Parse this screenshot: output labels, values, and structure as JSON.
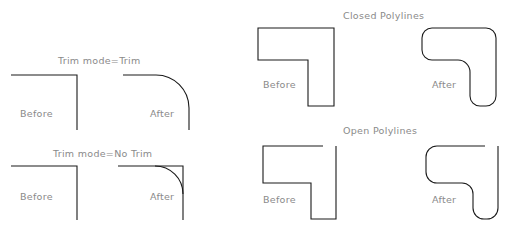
{
  "panels": {
    "trim": {
      "title": "Trim  mode=Trim",
      "before_label": "Before",
      "after_label": "After"
    },
    "no_trim": {
      "title": "Trim  mode=No  Trim",
      "before_label": "Before",
      "after_label": "After"
    },
    "closed": {
      "title": "Closed  Polylines",
      "before_label": "Before",
      "after_label": "After"
    },
    "open": {
      "title": "Open  Polylines",
      "before_label": "Before",
      "after_label": "After"
    }
  },
  "colors": {
    "line": "#1a1a1a",
    "text": "#8a8a8a",
    "background": "#ffffff"
  }
}
